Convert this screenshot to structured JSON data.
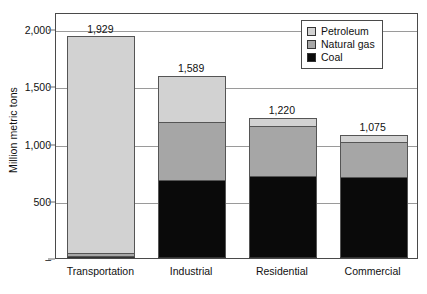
{
  "chart_data": {
    "type": "bar",
    "stacked": true,
    "title": "",
    "subtitle": "",
    "xlabel": "",
    "ylabel": "Million metric tons",
    "ylim": [
      0,
      2000
    ],
    "grid": true,
    "legend_position": "top-right",
    "categories": [
      "Transportation",
      "Industrial",
      "Residential",
      "Commercial"
    ],
    "totals": [
      1929,
      1589,
      1220,
      1075
    ],
    "total_labels": [
      "1,929",
      "1,589",
      "1,220",
      "1,075"
    ],
    "series": [
      {
        "name": "Petroleum",
        "color": "#d2d2d2",
        "values": [
          1888,
          404,
          65,
          58
        ]
      },
      {
        "name": "Natural gas",
        "color": "#a6a6a6",
        "values": [
          30,
          505,
          435,
          310
        ]
      },
      {
        "name": "Coal",
        "color": "#0a0a0a",
        "values": [
          11,
          680,
          720,
          707
        ]
      }
    ],
    "y_ticks": [
      {
        "value": 2000,
        "label": "2,000"
      },
      {
        "value": 1500,
        "label": "1,500"
      },
      {
        "value": 1000,
        "label": "1,000"
      },
      {
        "value": 500,
        "label": "500"
      },
      {
        "value": 0,
        "label": "–"
      }
    ]
  },
  "legend": {
    "items": [
      {
        "label": "Petroleum",
        "color": "#d2d2d2"
      },
      {
        "label": "Natural gas",
        "color": "#a6a6a6"
      },
      {
        "label": "Coal",
        "color": "#0a0a0a"
      }
    ]
  }
}
